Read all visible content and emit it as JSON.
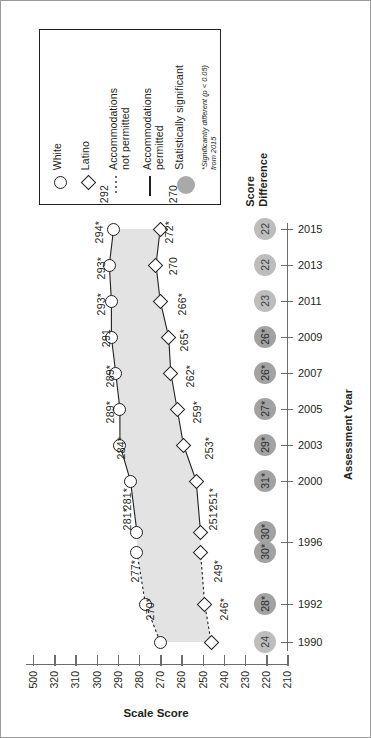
{
  "chart_data": {
    "type": "line",
    "title": "Scale Score",
    "xlabel": "Scale Score",
    "ylabel": "Assessment Year",
    "orientation": "rotated-90",
    "grid": false,
    "legend_position": "top-left",
    "xlim": [
      210,
      320
    ],
    "x_ticks": [
      "500",
      "320",
      "310",
      "300",
      "290",
      "280",
      "270",
      "260",
      "250",
      "240",
      "230",
      "220",
      "210"
    ],
    "categories": [
      "2015",
      "2013",
      "2011",
      "2009",
      "2007",
      "2005",
      "2003",
      "2000",
      "1996",
      "1996",
      "1992",
      "1990"
    ],
    "series": [
      {
        "name": "White",
        "marker": "circle",
        "values": [
          292,
          294,
          293,
          293,
          291,
          289,
          289,
          284,
          281,
          281,
          277,
          270
        ],
        "labels": [
          "292",
          "294*",
          "293*",
          "293*",
          "291",
          "289*",
          "289*",
          "284*",
          "281*",
          "281*",
          "277*",
          "270*"
        ]
      },
      {
        "name": "Latino",
        "marker": "diamond",
        "values": [
          270,
          272,
          270,
          266,
          265,
          262,
          259,
          253,
          251,
          251,
          249,
          246
        ],
        "labels": [
          "270",
          "272*",
          "270",
          "266*",
          "265*",
          "262*",
          "259*",
          "253*",
          "251*",
          "251*",
          "249*",
          "246*"
        ]
      }
    ],
    "score_difference": {
      "header": "Score\nDifference",
      "values": [
        22,
        22,
        23,
        26,
        26,
        27,
        29,
        31,
        30,
        30,
        28,
        24
      ],
      "labels": [
        "22",
        "22",
        "23",
        "26*",
        "26*",
        "27*",
        "29*",
        "31*",
        "30*",
        "30*",
        "28*",
        "24"
      ],
      "significant": [
        false,
        false,
        false,
        true,
        true,
        true,
        true,
        true,
        true,
        true,
        true,
        false
      ]
    },
    "year_ticks": [
      "2015",
      "2013",
      "2011",
      "2009",
      "2007",
      "2005",
      "2003",
      "2000",
      "1996",
      "1992",
      "1990"
    ],
    "accommodations": {
      "not_permitted_years": [
        "1996",
        "1992",
        "1990"
      ],
      "permitted_years": [
        "2015",
        "2013",
        "2011",
        "2009",
        "2007",
        "2005",
        "2003",
        "2000",
        "1996"
      ]
    },
    "colors": {
      "band": "#e3e3e3",
      "marker_stroke": "#231f20",
      "bubble": "#bdbdbd",
      "bubble_significant": "#a2a2a2",
      "axis": "#6d6d6d"
    }
  },
  "legend": {
    "entries": [
      {
        "label": "White",
        "icon": "circle-marker-icon"
      },
      {
        "label": "Latino",
        "icon": "diamond-marker-icon"
      },
      {
        "label": "Accommodations\nnot permitted",
        "icon": "dashed-line-icon"
      },
      {
        "label": "Accommodations\npermitted",
        "icon": "solid-line-icon"
      },
      {
        "label": "Statistically significant",
        "icon": "gray-circle-icon"
      }
    ],
    "footnote": "*Significantly different (p < 0.05)\nfrom 2015"
  },
  "axes": {
    "x_title": "Scale Score",
    "y_title": "Assessment Year",
    "score_difference_title": "Score\nDifference"
  }
}
